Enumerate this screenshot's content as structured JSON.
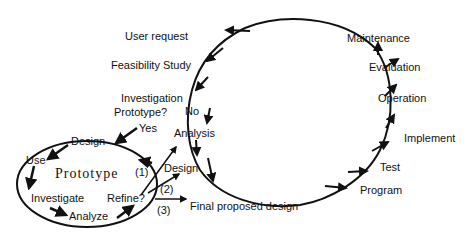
{
  "diagram": {
    "type": "system-development-life-cycle-with-prototyping",
    "stroke_color": "#111111",
    "background": "#ffffff",
    "main_cycle": {
      "labels": {
        "user_request": "User request",
        "feasibility_study": "Feasibility Study",
        "investigation": "Investigation",
        "prototype_question": "Prototype?",
        "no": "No",
        "yes": "Yes",
        "analysis": "Analysis",
        "design": "Design",
        "final_proposed_design": "Final proposed  design",
        "program": "Program",
        "test": "Test",
        "implement": "Implement",
        "operation": "Operation",
        "evaluation": "Evaluation",
        "maintenance": "Maintenance"
      }
    },
    "prototype_cycle": {
      "center_label": "Prototype",
      "labels": {
        "design": "Design",
        "use": "Use",
        "investigate": "Investigate",
        "analyze": "Analyze",
        "refine": "Refine?"
      }
    },
    "branches": {
      "b1": "(1)",
      "b2": "(2)",
      "b3": "(3)"
    }
  }
}
